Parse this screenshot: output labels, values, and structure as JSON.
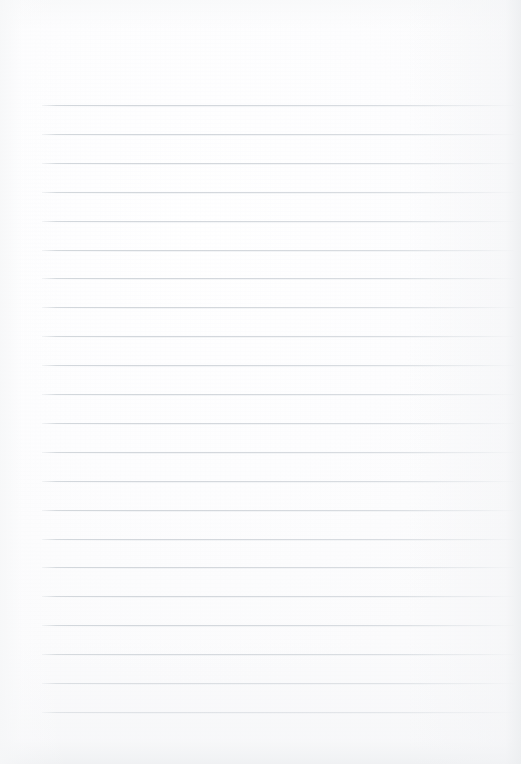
{
  "document": {
    "type": "lined-paper",
    "title": "",
    "content_text": "",
    "is_blank": true
  },
  "paper": {
    "width": 521,
    "height": 764,
    "background_color": "#fdfdfd",
    "edge_shadow_color": "#eceef0"
  },
  "ruling": {
    "line_color": "#d7dbdf",
    "line_thickness_px": 1,
    "line_count": 22,
    "first_line_y": 105,
    "line_spacing_px": 28.9,
    "line_start_x": 42,
    "line_end_x": 514,
    "top_margin_px": 105,
    "bottom_margin_px": 52,
    "left_margin_px": 42,
    "right_margin_px": 7,
    "has_vertical_margin_rule": false,
    "lines_y": [
      105,
      133.9,
      162.8,
      191.7,
      220.6,
      249.5,
      278.4,
      307.3,
      336.2,
      365.1,
      394.0,
      422.9,
      451.8,
      480.7,
      509.6,
      538.5,
      567.4,
      596.3,
      625.2,
      654.1,
      683.0,
      711.9
    ]
  }
}
